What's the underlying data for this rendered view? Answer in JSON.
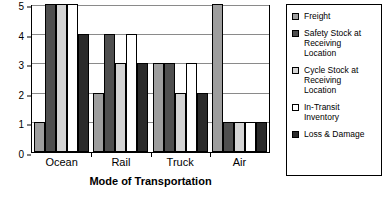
{
  "chart_data": {
    "type": "bar",
    "title": "",
    "xlabel": "Mode of Transportation",
    "ylabel": "",
    "categories": [
      "Ocean",
      "Rail",
      "Truck",
      "Air"
    ],
    "series": [
      {
        "name": "Freight",
        "values": [
          1,
          2,
          3,
          5
        ],
        "color": "#9e9e9e"
      },
      {
        "name": "Safety Stock at\nReceiving\nLocation",
        "values": [
          5,
          4,
          3,
          1
        ],
        "color": "#4f4f4f"
      },
      {
        "name": "Cycle Stock at\nReceiving\nLocation",
        "values": [
          5,
          3,
          2,
          1
        ],
        "color": "#d4d4d4"
      },
      {
        "name": "In-Transit\nInventory",
        "values": [
          5,
          4,
          3,
          1
        ],
        "color": "#ffffff"
      },
      {
        "name": "Loss & Damage",
        "values": [
          4,
          3,
          2,
          1
        ],
        "color": "#2b2b2b"
      }
    ],
    "ylim": [
      0,
      5
    ],
    "y_ticks": [
      0,
      1,
      2,
      3,
      4,
      5
    ],
    "y_tick_labels": [
      "0",
      "1",
      "2",
      "3",
      "4",
      "5"
    ],
    "grid": true,
    "legend_position": "right",
    "legend_border": true,
    "axis_color": "#000000",
    "grid_color": "#8a8a8a",
    "background": "#ffffff"
  }
}
